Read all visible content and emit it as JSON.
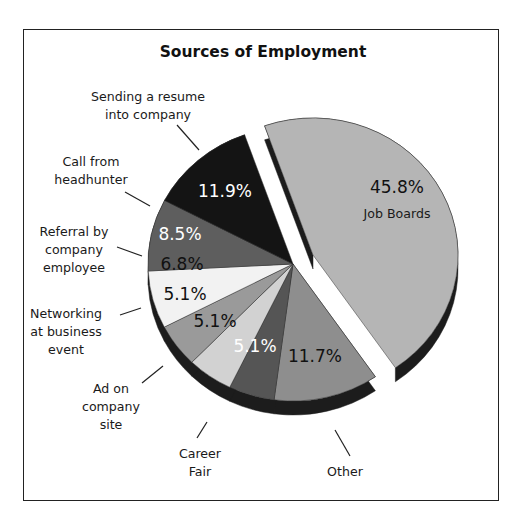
{
  "chart_data": {
    "type": "pie",
    "title": "Sources of Employment",
    "style": "3d-exploded",
    "exploded": [
      "Job Boards"
    ],
    "slices": [
      {
        "label": "Job Boards",
        "value": 45.8,
        "display": "45.8%",
        "color": "#b5b5b5",
        "text_color": "#111111"
      },
      {
        "label": "Other",
        "value": 11.7,
        "display": "11.7%",
        "color": "#8e8e8e",
        "text_color": "#111111"
      },
      {
        "label": "Career Fair",
        "value": 5.1,
        "display": "5.1%",
        "color": "#555555",
        "text_color": "#ffffff"
      },
      {
        "label": "Ad on company site",
        "value": 5.1,
        "display": "5.1%",
        "color": "#d2d2d2",
        "text_color": "#111111"
      },
      {
        "label": "Networking at business event",
        "value": 5.1,
        "display": "5.1%",
        "color": "#9a9a9a",
        "text_color": "#111111"
      },
      {
        "label": "Referral by company employee",
        "value": 6.8,
        "display": "6.8%",
        "color": "#f2f2f2",
        "text_color": "#111111"
      },
      {
        "label": "Call from headhunter",
        "value": 8.5,
        "display": "8.5%",
        "color": "#5e5e5e",
        "text_color": "#ffffff"
      },
      {
        "label": "Sending a resume into company",
        "value": 11.9,
        "display": "11.9%",
        "color": "#141414",
        "text_color": "#ffffff"
      }
    ],
    "legend": "none (callout labels)"
  },
  "title": "Sources of Employment",
  "callouts": {
    "resume": [
      "Sending a resume",
      "into company"
    ],
    "headhunter": [
      "Call from",
      "headhunter"
    ],
    "referral": [
      "Referral by",
      "company",
      "employee"
    ],
    "networking": [
      "Networking",
      "at business",
      "event"
    ],
    "ad": [
      "Ad on",
      "company",
      "site"
    ],
    "career": [
      "Career",
      "Fair"
    ],
    "other": [
      "Other"
    ],
    "jobboards": "Job Boards"
  }
}
